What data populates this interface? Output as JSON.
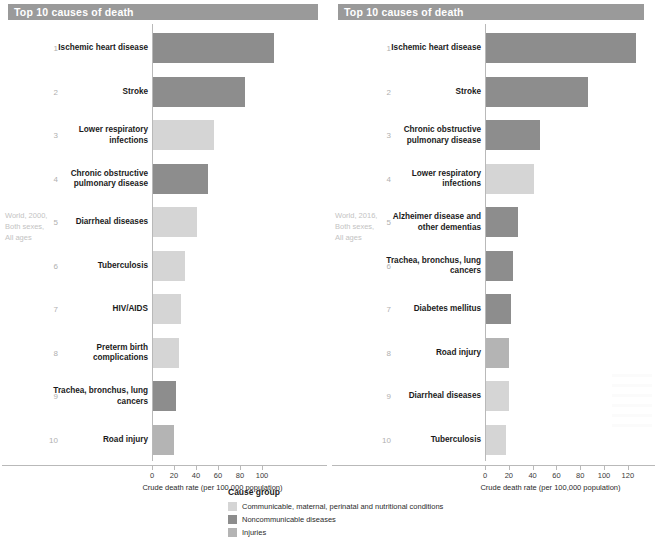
{
  "colors": {
    "communicable": "#d5d5d5",
    "noncommunicable": "#8d8d8d",
    "injuries": "#b4b4b4",
    "header_bar": "#9a9a9a",
    "axis": "#b9b9b9",
    "caption_text": "#c3c3c3"
  },
  "legend": {
    "title": "Cause group",
    "items": [
      {
        "label": "Communicable, maternal, perinatal and nutritional conditions",
        "color": "#d5d5d5",
        "key": "communicable"
      },
      {
        "label": "Noncommunicable diseases",
        "color": "#8d8d8d",
        "key": "noncommunicable"
      },
      {
        "label": "Injuries",
        "color": "#b4b4b4",
        "key": "injuries"
      }
    ]
  },
  "panels": [
    {
      "id": "left",
      "header": "Top 10 causes of death",
      "caption": "World, 2000, Both sexes, All ages",
      "axis_title": "Crude death rate (per 100,000 population)",
      "ticks": [
        0,
        20,
        40,
        60,
        80,
        100
      ],
      "xmax": 118,
      "rows": [
        {
          "rank": "1",
          "label": "Ischemic heart disease",
          "value": 110,
          "group": "noncommunicable"
        },
        {
          "rank": "2",
          "label": "Stroke",
          "value": 84,
          "group": "noncommunicable"
        },
        {
          "rank": "3",
          "label": "Lower respiratory infections",
          "value": 55,
          "group": "communicable"
        },
        {
          "rank": "4",
          "label": "Chronic obstructive pulmonary disease",
          "value": 50,
          "group": "noncommunicable"
        },
        {
          "rank": "5",
          "label": "Diarrheal diseases",
          "value": 40,
          "group": "communicable"
        },
        {
          "rank": "6",
          "label": "Tuberculosis",
          "value": 29,
          "group": "communicable"
        },
        {
          "rank": "7",
          "label": "HIV/AIDS",
          "value": 25,
          "group": "communicable"
        },
        {
          "rank": "8",
          "label": "Preterm birth complications",
          "value": 24,
          "group": "communicable"
        },
        {
          "rank": "9",
          "label": "Trachea, bronchus, lung cancers",
          "value": 21,
          "group": "noncommunicable"
        },
        {
          "rank": "10",
          "label": "Road injury",
          "value": 19,
          "group": "injuries"
        }
      ]
    },
    {
      "id": "right",
      "header": "Top 10 causes of death",
      "caption": "World, 2016, Both sexes, All ages",
      "axis_title": "Crude death rate (per 100,000 population)",
      "ticks": [
        0,
        20,
        40,
        60,
        80,
        100,
        120
      ],
      "xmax": 138,
      "rows": [
        {
          "rank": "1",
          "label": "Ischemic heart disease",
          "value": 126,
          "group": "noncommunicable"
        },
        {
          "rank": "2",
          "label": "Stroke",
          "value": 86,
          "group": "noncommunicable"
        },
        {
          "rank": "3",
          "label": "Chronic obstructive pulmonary disease",
          "value": 45,
          "group": "noncommunicable"
        },
        {
          "rank": "4",
          "label": "Lower respiratory infections",
          "value": 40,
          "group": "communicable"
        },
        {
          "rank": "5",
          "label": "Alzheimer disease and other dementias",
          "value": 27,
          "group": "noncommunicable"
        },
        {
          "rank": "6",
          "label": "Trachea, bronchus, lung cancers",
          "value": 23,
          "group": "noncommunicable"
        },
        {
          "rank": "7",
          "label": "Diabetes mellitus",
          "value": 21,
          "group": "noncommunicable"
        },
        {
          "rank": "8",
          "label": "Road injury",
          "value": 19,
          "group": "injuries"
        },
        {
          "rank": "9",
          "label": "Diarrheal diseases",
          "value": 19,
          "group": "communicable"
        },
        {
          "rank": "10",
          "label": "Tuberculosis",
          "value": 17,
          "group": "communicable"
        }
      ]
    }
  ],
  "chart_data": [
    {
      "type": "bar",
      "title": "Top 10 causes of death",
      "subtitle": "World, 2000, Both sexes, All ages",
      "orientation": "horizontal",
      "xlabel": "Crude death rate (per 100,000 population)",
      "ylabel": "",
      "xlim": [
        0,
        118
      ],
      "xticks": [
        0,
        20,
        40,
        60,
        80,
        100
      ],
      "grid": false,
      "legend": "bottom-center",
      "categories": [
        "Ischemic heart disease",
        "Stroke",
        "Lower respiratory infections",
        "Chronic obstructive pulmonary disease",
        "Diarrheal diseases",
        "Tuberculosis",
        "HIV/AIDS",
        "Preterm birth complications",
        "Trachea, bronchus, lung cancers",
        "Road injury"
      ],
      "values": [
        110,
        84,
        55,
        50,
        40,
        29,
        25,
        24,
        21,
        19
      ],
      "groups": [
        "Noncommunicable diseases",
        "Noncommunicable diseases",
        "Communicable, maternal, perinatal and nutritional conditions",
        "Noncommunicable diseases",
        "Communicable, maternal, perinatal and nutritional conditions",
        "Communicable, maternal, perinatal and nutritional conditions",
        "Communicable, maternal, perinatal and nutritional conditions",
        "Communicable, maternal, perinatal and nutritional conditions",
        "Noncommunicable diseases",
        "Injuries"
      ]
    },
    {
      "type": "bar",
      "title": "Top 10 causes of death",
      "subtitle": "World, 2016, Both sexes, All ages",
      "orientation": "horizontal",
      "xlabel": "Crude death rate (per 100,000 population)",
      "ylabel": "",
      "xlim": [
        0,
        138
      ],
      "xticks": [
        0,
        20,
        40,
        60,
        80,
        100,
        120
      ],
      "grid": false,
      "legend": "bottom-center",
      "categories": [
        "Ischemic heart disease",
        "Stroke",
        "Chronic obstructive pulmonary disease",
        "Lower respiratory infections",
        "Alzheimer disease and other dementias",
        "Trachea, bronchus, lung cancers",
        "Diabetes mellitus",
        "Road injury",
        "Diarrheal diseases",
        "Tuberculosis"
      ],
      "values": [
        126,
        86,
        45,
        40,
        27,
        23,
        21,
        19,
        19,
        17
      ],
      "groups": [
        "Noncommunicable diseases",
        "Noncommunicable diseases",
        "Noncommunicable diseases",
        "Communicable, maternal, perinatal and nutritional conditions",
        "Noncommunicable diseases",
        "Noncommunicable diseases",
        "Noncommunicable diseases",
        "Injuries",
        "Communicable, maternal, perinatal and nutritional conditions",
        "Communicable, maternal, perinatal and nutritional conditions"
      ]
    }
  ]
}
